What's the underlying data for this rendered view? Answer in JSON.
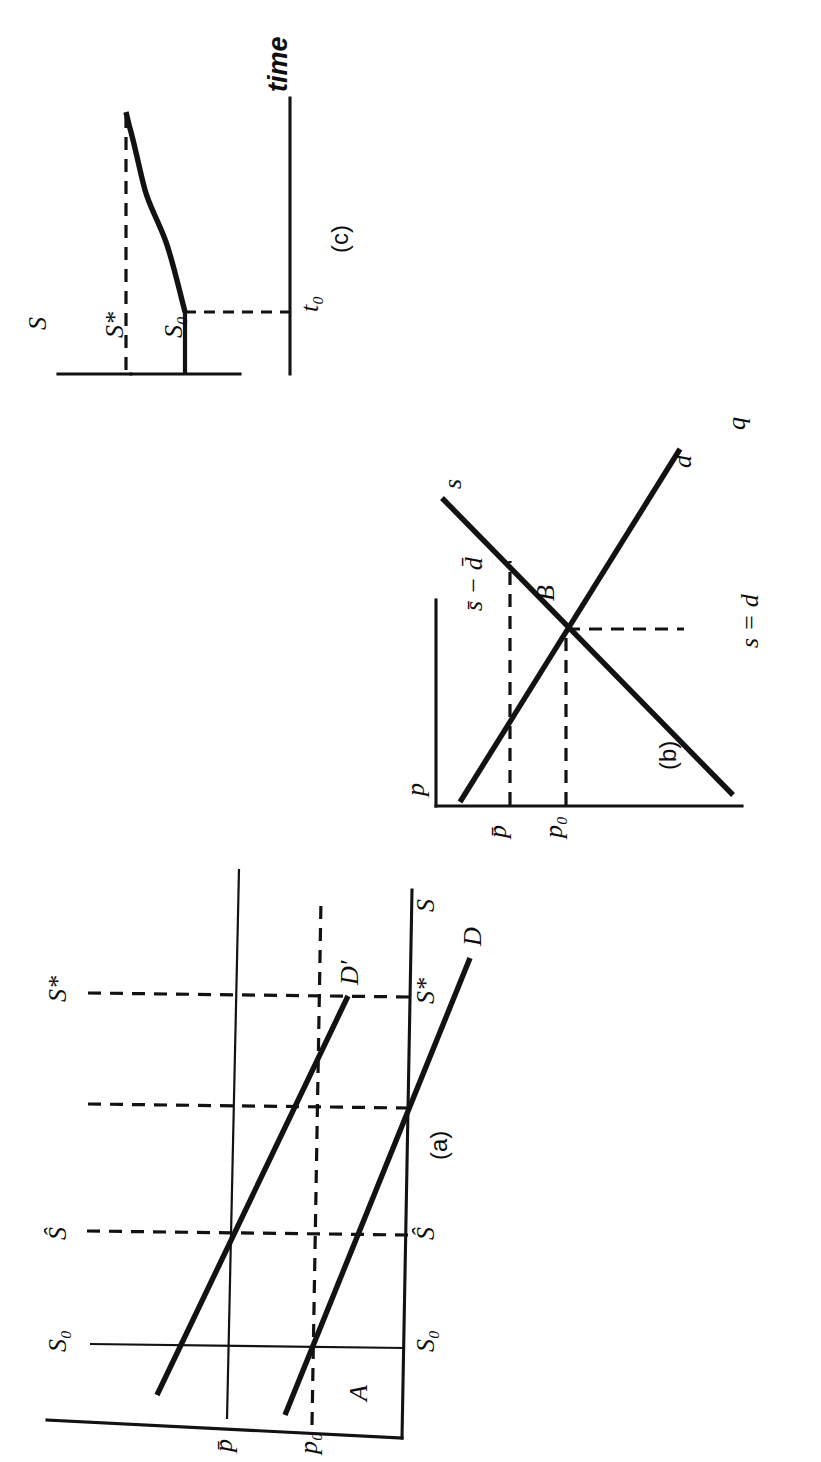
{
  "figure": {
    "orientation": "rotated-90-counterclockwise",
    "background_color": "#ffffff",
    "ink_color": "#121212",
    "panels": [
      {
        "id": "a",
        "caption": "(a)",
        "description": "Stock-price diagram: vertical axis p (price), horizontal axis S (stock). Demand curves D and D' shift; equilibrium points A and intersections with stock levels.",
        "axes": {
          "vertical_label": "p",
          "horizontal_label": "S"
        },
        "vertical_ticks": [
          {
            "label": "p̄",
            "plain": "p-bar"
          },
          {
            "label": "p₀",
            "plain": "p0"
          }
        ],
        "horizontal_ticks": [
          {
            "label": "S₀",
            "plain": "S0"
          },
          {
            "label": "Ŝ",
            "plain": "S-hat"
          },
          {
            "label": "S*",
            "plain": "S-star"
          }
        ],
        "curves": [
          {
            "name": "D",
            "label": "D"
          },
          {
            "name": "D-prime",
            "label": "D′"
          }
        ],
        "points": [
          {
            "label": "A"
          }
        ]
      },
      {
        "id": "b",
        "caption": "(b)",
        "description": "Flow supply and demand: vertical axis p (price), horizontal axis q (quantity). Upward flow supply s and downward flow demand d cross at B.",
        "axes": {
          "vertical_label": "p",
          "horizontal_label": "q"
        },
        "vertical_ticks": [
          {
            "label": "p̄",
            "plain": "p-bar"
          },
          {
            "label": "p₀",
            "plain": "p0"
          }
        ],
        "horizontal_ticks": [
          {
            "label": "s = d",
            "plain": "s equals d"
          }
        ],
        "curves": [
          {
            "name": "s",
            "label": "s"
          },
          {
            "name": "d",
            "label": "d"
          }
        ],
        "points": [
          {
            "label": "B"
          }
        ],
        "annotations": [
          {
            "label": "s̄ − d̄",
            "plain": "s-bar minus d-bar"
          }
        ]
      },
      {
        "id": "c",
        "caption": "(c)",
        "description": "Time path of the stock: vertical axis S, horizontal axis time. Stock held at S0 until t0, then rises asymptotically toward S*.",
        "axes": {
          "vertical_label": "S",
          "horizontal_label": "time"
        },
        "vertical_ticks": [
          {
            "label": "S*",
            "plain": "S-star"
          },
          {
            "label": "S₀",
            "plain": "S0"
          }
        ],
        "horizontal_ticks": [
          {
            "label": "t₀",
            "plain": "t0"
          }
        ]
      }
    ],
    "all_text_labels": [
      "S",
      "S*",
      "S₀",
      "t₀",
      "time",
      "(c)",
      "p",
      "s",
      "s̄ − d̄",
      "B",
      "p̄",
      "p₀",
      "d",
      "q",
      "s = d",
      "(b)",
      "S*",
      "Ŝ",
      "S₀",
      "D′",
      "D",
      "A",
      "(a)"
    ]
  }
}
